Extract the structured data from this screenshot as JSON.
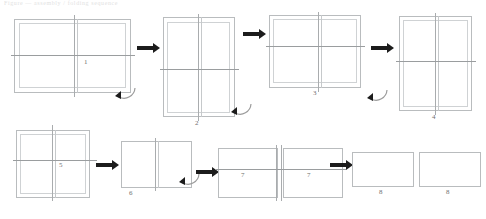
{
  "figure": {
    "caption": "Figure — assembly / folding sequence",
    "type": "step-sequence-diagram",
    "step_count": 8,
    "line_color": "#b9bcbe",
    "arrow_color": "#1c1c1c",
    "label_color": "#6f6f6f"
  },
  "steps": [
    {
      "id": 1,
      "label": "1",
      "orientation": "landscape",
      "note": "wide frame, vertical centre mullion, horizontal rail"
    },
    {
      "id": 2,
      "label": "2",
      "orientation": "portrait",
      "note": "rotated upright, vertical mullion, horizontal rail"
    },
    {
      "id": 3,
      "label": "3",
      "orientation": "landscape",
      "note": "wide frame, vertical mullion right of centre"
    },
    {
      "id": 4,
      "label": "4",
      "orientation": "portrait",
      "note": "upright frame, mullion and rail"
    },
    {
      "id": 5,
      "label": "5",
      "orientation": "portrait",
      "note": "upright frame, centre cross"
    },
    {
      "id": 6,
      "label": "6",
      "orientation": "landscape",
      "note": "low frame split by single vertical line"
    },
    {
      "id": 7,
      "label": "7",
      "orientation": "landscape",
      "note": "pair of frames with centre cross"
    },
    {
      "id": 8,
      "label": "8",
      "orientation": "landscape",
      "note": "pair of plain rectangles, final state"
    }
  ],
  "arrows": {
    "straight": [
      {
        "name": "arrow-1-to-2"
      },
      {
        "name": "arrow-2-to-3"
      },
      {
        "name": "arrow-3-to-4"
      },
      {
        "name": "arrow-5-to-6"
      },
      {
        "name": "arrow-6-to-7"
      },
      {
        "name": "arrow-7-to-8"
      }
    ],
    "curved": [
      {
        "name": "rotate-arrow-step-1"
      },
      {
        "name": "rotate-arrow-step-2"
      },
      {
        "name": "rotate-arrow-step-3"
      },
      {
        "name": "rotate-arrow-step-6"
      }
    ]
  }
}
